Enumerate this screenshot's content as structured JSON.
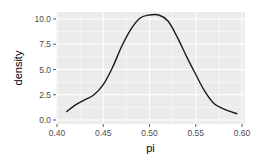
{
  "chart_data": {
    "type": "line",
    "title": "",
    "xlabel": "pi",
    "ylabel": "density",
    "xlim": [
      0.4,
      0.6
    ],
    "ylim": [
      0.0,
      10.0
    ],
    "x_ticks": [
      0.4,
      0.45,
      0.5,
      0.55,
      0.6
    ],
    "x_tick_labels": [
      "0.40",
      "0.45",
      "0.50",
      "0.55",
      "0.60"
    ],
    "y_ticks": [
      0.0,
      2.5,
      5.0,
      7.5,
      10.0
    ],
    "y_tick_labels": [
      "0.0",
      "2.5",
      "5.0",
      "7.5",
      "10.0"
    ],
    "grid": true,
    "legend": "none",
    "series": [
      {
        "name": "density",
        "x": [
          0.41,
          0.42,
          0.43,
          0.44,
          0.45,
          0.46,
          0.47,
          0.48,
          0.49,
          0.5,
          0.51,
          0.52,
          0.53,
          0.54,
          0.55,
          0.56,
          0.57,
          0.58,
          0.595
        ],
        "values": [
          0.8,
          1.5,
          2.0,
          2.5,
          3.5,
          5.2,
          7.3,
          9.0,
          10.1,
          10.4,
          10.4,
          9.8,
          8.2,
          6.3,
          4.5,
          2.8,
          1.6,
          1.1,
          0.6
        ]
      }
    ]
  },
  "colors": {
    "panel_bg": "#ebebeb",
    "grid_major": "#ffffff",
    "line": "#1a1a1a"
  }
}
